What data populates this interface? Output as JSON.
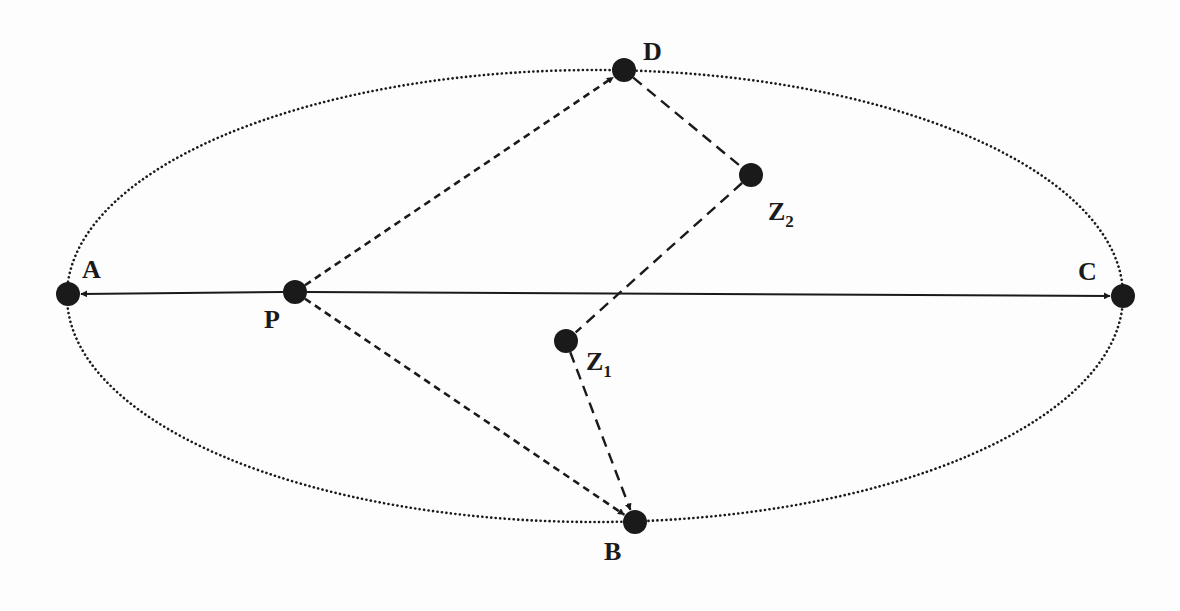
{
  "figure": {
    "type": "ellipse-path-diagram",
    "background": "#fdfdfd",
    "ink_color": "#1a1a1a",
    "ellipse": {
      "cx": 595,
      "cy": 296,
      "rx": 528,
      "ry": 226,
      "style": "dotted"
    },
    "nodes": [
      {
        "id": "A",
        "label": "A",
        "subscript": "",
        "x": 68,
        "y": 294,
        "label_x": 82,
        "label_y": 278
      },
      {
        "id": "P",
        "label": "P",
        "subscript": "",
        "x": 295,
        "y": 292,
        "label_x": 264,
        "label_y": 328
      },
      {
        "id": "D",
        "label": "D",
        "subscript": "",
        "x": 624,
        "y": 70,
        "label_x": 643,
        "label_y": 60
      },
      {
        "id": "Z2",
        "label": "Z",
        "subscript": "2",
        "x": 751,
        "y": 175,
        "label_x": 768,
        "label_y": 220
      },
      {
        "id": "Z1",
        "label": "Z",
        "subscript": "1",
        "x": 566,
        "y": 341,
        "label_x": 586,
        "label_y": 370
      },
      {
        "id": "B",
        "label": "B",
        "subscript": "",
        "x": 635,
        "y": 522,
        "label_x": 604,
        "label_y": 560
      },
      {
        "id": "C",
        "label": "C",
        "subscript": "",
        "x": 1123,
        "y": 296,
        "label_x": 1078,
        "label_y": 280
      }
    ],
    "edges": [
      {
        "from": "P",
        "to": "A",
        "style": "solid",
        "arrow": true
      },
      {
        "from": "P",
        "to": "C",
        "style": "solid",
        "arrow": true
      },
      {
        "from": "P",
        "to": "D",
        "style": "short-dash",
        "arrow": true
      },
      {
        "from": "P",
        "to": "B",
        "style": "short-dash",
        "arrow": true
      },
      {
        "from": "D",
        "to": "Z2",
        "style": "long-dash",
        "arrow": false
      },
      {
        "from": "Z2",
        "to": "Z1",
        "style": "long-dash",
        "arrow": false
      },
      {
        "from": "Z1",
        "to": "B",
        "style": "long-dash",
        "arrow": true
      }
    ]
  }
}
